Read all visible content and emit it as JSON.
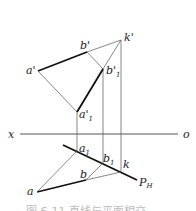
{
  "diagram": {
    "type": "descriptive-geometry-projection",
    "axis": {
      "left_label": "x",
      "right_label": "o"
    },
    "points": {
      "a_prime": "a'",
      "b_prime": "b'",
      "k_prime": "k'",
      "b1_prime": "b'",
      "b1_prime_sub": "1",
      "a1_prime": "a'",
      "a1_prime_sub": "1",
      "a1": "a",
      "a1_sub": "1",
      "b1": "b",
      "b1_sub": "1",
      "k": "k",
      "a": "a",
      "b": "b",
      "plane_trace": "P",
      "plane_trace_sub": "H"
    },
    "caption": "图 6-11  直线与平面相交"
  }
}
